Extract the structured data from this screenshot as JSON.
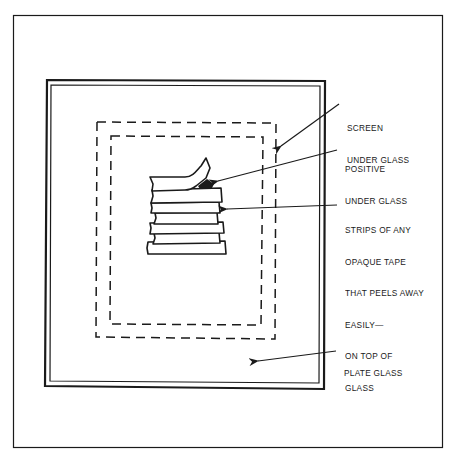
{
  "diagram": {
    "type": "screen-printing setup illustration",
    "labels": {
      "screen": [
        "SCREEN",
        "UNDER GLASS"
      ],
      "positive": [
        "POSITIVE",
        "UNDER GLASS"
      ],
      "strips": [
        "STRIPS OF ANY",
        "OPAQUE TAPE",
        "THAT PEELS AWAY",
        "EASILY—",
        "ON TOP OF",
        "GLASS"
      ],
      "plate_glass": [
        "PLATE GLASS"
      ]
    },
    "elements": [
      {
        "name": "outer-frame",
        "style": "thin solid"
      },
      {
        "name": "plate-glass",
        "style": "double solid border"
      },
      {
        "name": "screen",
        "style": "dashed rectangle (outer)"
      },
      {
        "name": "positive",
        "style": "dashed rectangle (inner)"
      },
      {
        "name": "tape-strips",
        "count": 6,
        "style": "stacked strips, top strip peeling"
      }
    ],
    "colors": {
      "ink": "#1a1a1a",
      "background": "#ffffff"
    }
  }
}
